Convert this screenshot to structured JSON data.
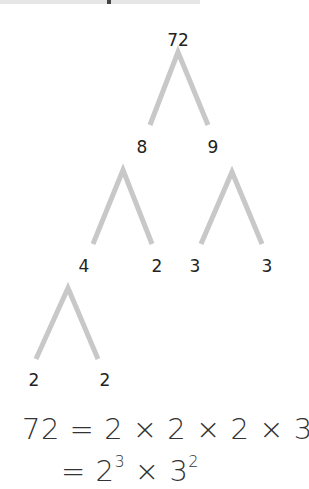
{
  "diagram": {
    "type": "factor-tree",
    "line_color": "#c8c8c8",
    "nodes": [
      {
        "id": "n72",
        "label": "72",
        "x": 178,
        "y": 40
      },
      {
        "id": "n8",
        "label": "8",
        "x": 142,
        "y": 147
      },
      {
        "id": "n9",
        "label": "9",
        "x": 213,
        "y": 147
      },
      {
        "id": "n4",
        "label": "4",
        "x": 84,
        "y": 266
      },
      {
        "id": "n2a",
        "label": "2",
        "x": 157,
        "y": 266
      },
      {
        "id": "n3a",
        "label": "3",
        "x": 195,
        "y": 266
      },
      {
        "id": "n3b",
        "label": "3",
        "x": 267,
        "y": 266
      },
      {
        "id": "n2b",
        "label": "2",
        "x": 34,
        "y": 380
      },
      {
        "id": "n2c",
        "label": "2",
        "x": 105,
        "y": 380
      }
    ],
    "edges": [
      {
        "from": "n72",
        "apex": [
          178,
          52
        ],
        "left": [
          150,
          125
        ],
        "right": [
          208,
          125
        ]
      },
      {
        "from": "n8",
        "apex": [
          123,
          170
        ],
        "left": [
          93,
          244
        ],
        "right": [
          152,
          244
        ]
      },
      {
        "from": "n9",
        "apex": [
          232,
          172
        ],
        "left": [
          201,
          244
        ],
        "right": [
          262,
          244
        ]
      },
      {
        "from": "n4",
        "apex": [
          68,
          288
        ],
        "left": [
          36,
          359
        ],
        "right": [
          98,
          359
        ]
      }
    ]
  },
  "equation": {
    "line1": "72 = 2 × 2 × 2 × 3 × 3",
    "line2_prefix": "= 2",
    "line2_exp1": "3",
    "line2_mid": " × 3",
    "line2_exp2": "2"
  }
}
